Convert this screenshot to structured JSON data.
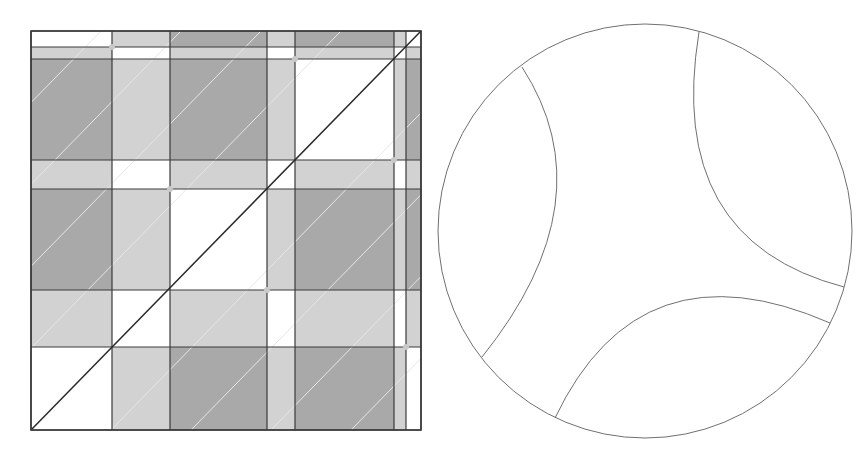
{
  "colors": {
    "background": "#ffffff",
    "white_fill": "#ffffff",
    "light_fill": "#d2d2d2",
    "dark_fill": "#a9a9a9",
    "grid_line": "#3a3a3a",
    "diagonal_line": "#2a2a2a",
    "faint_diagonal": "#e6e6e6",
    "intersection_dot": "#c8c8c8",
    "circle_stroke": "#707070"
  },
  "square_diagram": {
    "x_lines": [
      31,
      112,
      170,
      267,
      295,
      394,
      406,
      421
    ],
    "y_lines": [
      31,
      47,
      59,
      160,
      189,
      290,
      347,
      430
    ],
    "cell_pattern_top_to_bottom": [
      [
        "W",
        "L",
        "D",
        "L",
        "D",
        "L",
        "W"
      ],
      [
        "L",
        "W",
        "L",
        "W",
        "L",
        "W",
        "L"
      ],
      [
        "D",
        "L",
        "D",
        "L",
        "W",
        "L",
        "D"
      ],
      [
        "L",
        "W",
        "L",
        "W",
        "L",
        "W",
        "L"
      ],
      [
        "D",
        "L",
        "W",
        "L",
        "D",
        "L",
        "D"
      ],
      [
        "L",
        "W",
        "L",
        "W",
        "L",
        "W",
        "L"
      ],
      [
        "W",
        "L",
        "D",
        "L",
        "D",
        "L",
        "W"
      ]
    ],
    "main_diagonal": {
      "from": [
        31,
        430
      ],
      "to": [
        421,
        31
      ]
    },
    "faint_diagonal_offsets": [
      -320,
      -240,
      -160,
      -80,
      80,
      160,
      240,
      320
    ],
    "intersection_dots": [
      [
        112,
        47
      ],
      [
        295,
        59
      ],
      [
        394,
        160
      ],
      [
        170,
        189
      ],
      [
        267,
        290
      ],
      [
        406,
        347
      ]
    ]
  },
  "circle_diagram": {
    "center": [
      645,
      231
    ],
    "radius": 207,
    "arcs": [
      {
        "name": "left-arc",
        "from": [
          522,
          67
        ],
        "control": [
          608,
          200
        ],
        "to": [
          482,
          357
        ]
      },
      {
        "name": "top-right-arc",
        "from": [
          699,
          32
        ],
        "control": [
          665,
          240
        ],
        "to": [
          844,
          287
        ]
      },
      {
        "name": "bottom-arc",
        "from": [
          830,
          323
        ],
        "control": [
          640,
          240
        ],
        "to": [
          555,
          418
        ]
      }
    ]
  }
}
